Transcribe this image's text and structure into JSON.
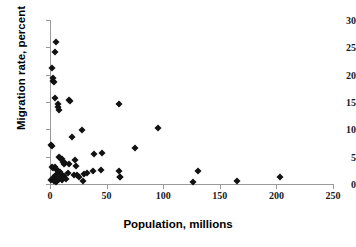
{
  "chart_data": {
    "type": "scatter",
    "title": "",
    "xlabel": "Population, millions",
    "ylabel": "Migration rate, percent",
    "xlim": [
      0,
      250
    ],
    "ylim": [
      0,
      30
    ],
    "xticks": [
      0,
      50,
      100,
      150,
      200,
      250
    ],
    "yticks": [
      0,
      5,
      10,
      15,
      20,
      25,
      30
    ],
    "grid": false,
    "legend": null,
    "marker": "diamond",
    "marker_color": "#111111",
    "axis_color": "#9a9a9a",
    "points": [
      {
        "x": 5.0,
        "y": 26.0
      },
      {
        "x": 4.0,
        "y": 24.1
      },
      {
        "x": 1.5,
        "y": 21.3
      },
      {
        "x": 2.5,
        "y": 19.4
      },
      {
        "x": 3.0,
        "y": 18.9
      },
      {
        "x": 3.5,
        "y": 18.6
      },
      {
        "x": 4.0,
        "y": 15.7
      },
      {
        "x": 7.0,
        "y": 14.6
      },
      {
        "x": 7.5,
        "y": 14.0
      },
      {
        "x": 8.0,
        "y": 13.5
      },
      {
        "x": 16.5,
        "y": 15.3
      },
      {
        "x": 18.0,
        "y": 15.2
      },
      {
        "x": 61.0,
        "y": 14.7
      },
      {
        "x": 28.0,
        "y": 9.9
      },
      {
        "x": 95.5,
        "y": 10.2
      },
      {
        "x": 19.5,
        "y": 8.6
      },
      {
        "x": 75.0,
        "y": 6.5
      },
      {
        "x": 0.5,
        "y": 7.2
      },
      {
        "x": 1.5,
        "y": 7.0
      },
      {
        "x": 39.0,
        "y": 5.5
      },
      {
        "x": 45.5,
        "y": 5.6
      },
      {
        "x": 8.0,
        "y": 5.0
      },
      {
        "x": 9.0,
        "y": 4.7
      },
      {
        "x": 10.5,
        "y": 4.6
      },
      {
        "x": 22.0,
        "y": 4.4
      },
      {
        "x": 11.5,
        "y": 4.1
      },
      {
        "x": 13.0,
        "y": 3.9
      },
      {
        "x": 12.0,
        "y": 3.6
      },
      {
        "x": 17.0,
        "y": 3.7
      },
      {
        "x": 23.0,
        "y": 3.3
      },
      {
        "x": 2.0,
        "y": 3.1
      },
      {
        "x": 3.0,
        "y": 2.9
      },
      {
        "x": 4.5,
        "y": 3.2
      },
      {
        "x": 6.0,
        "y": 2.6
      },
      {
        "x": 7.0,
        "y": 2.4
      },
      {
        "x": 8.5,
        "y": 2.2
      },
      {
        "x": 9.5,
        "y": 1.9
      },
      {
        "x": 5.5,
        "y": 1.7
      },
      {
        "x": 4.0,
        "y": 1.4
      },
      {
        "x": 2.5,
        "y": 1.1
      },
      {
        "x": 1.0,
        "y": 0.8
      },
      {
        "x": 3.5,
        "y": 0.5
      },
      {
        "x": 5.0,
        "y": 0.4
      },
      {
        "x": 6.5,
        "y": 0.6
      },
      {
        "x": 8.0,
        "y": 0.9
      },
      {
        "x": 10.0,
        "y": 1.2
      },
      {
        "x": 11.0,
        "y": 0.7
      },
      {
        "x": 12.5,
        "y": 1.5
      },
      {
        "x": 14.0,
        "y": 1.0
      },
      {
        "x": 15.5,
        "y": 2.0
      },
      {
        "x": 21.0,
        "y": 1.6
      },
      {
        "x": 23.5,
        "y": 1.7
      },
      {
        "x": 26.0,
        "y": 1.3
      },
      {
        "x": 29.0,
        "y": 0.6
      },
      {
        "x": 30.0,
        "y": 1.8
      },
      {
        "x": 33.0,
        "y": 2.1
      },
      {
        "x": 38.0,
        "y": 2.3
      },
      {
        "x": 45.0,
        "y": 2.5
      },
      {
        "x": 61.0,
        "y": 2.4
      },
      {
        "x": 61.5,
        "y": 1.3
      },
      {
        "x": 62.0,
        "y": 1.2
      },
      {
        "x": 126.0,
        "y": 0.4
      },
      {
        "x": 131.0,
        "y": 2.3
      },
      {
        "x": 165.5,
        "y": 0.5
      },
      {
        "x": 203.0,
        "y": 1.3
      }
    ]
  }
}
